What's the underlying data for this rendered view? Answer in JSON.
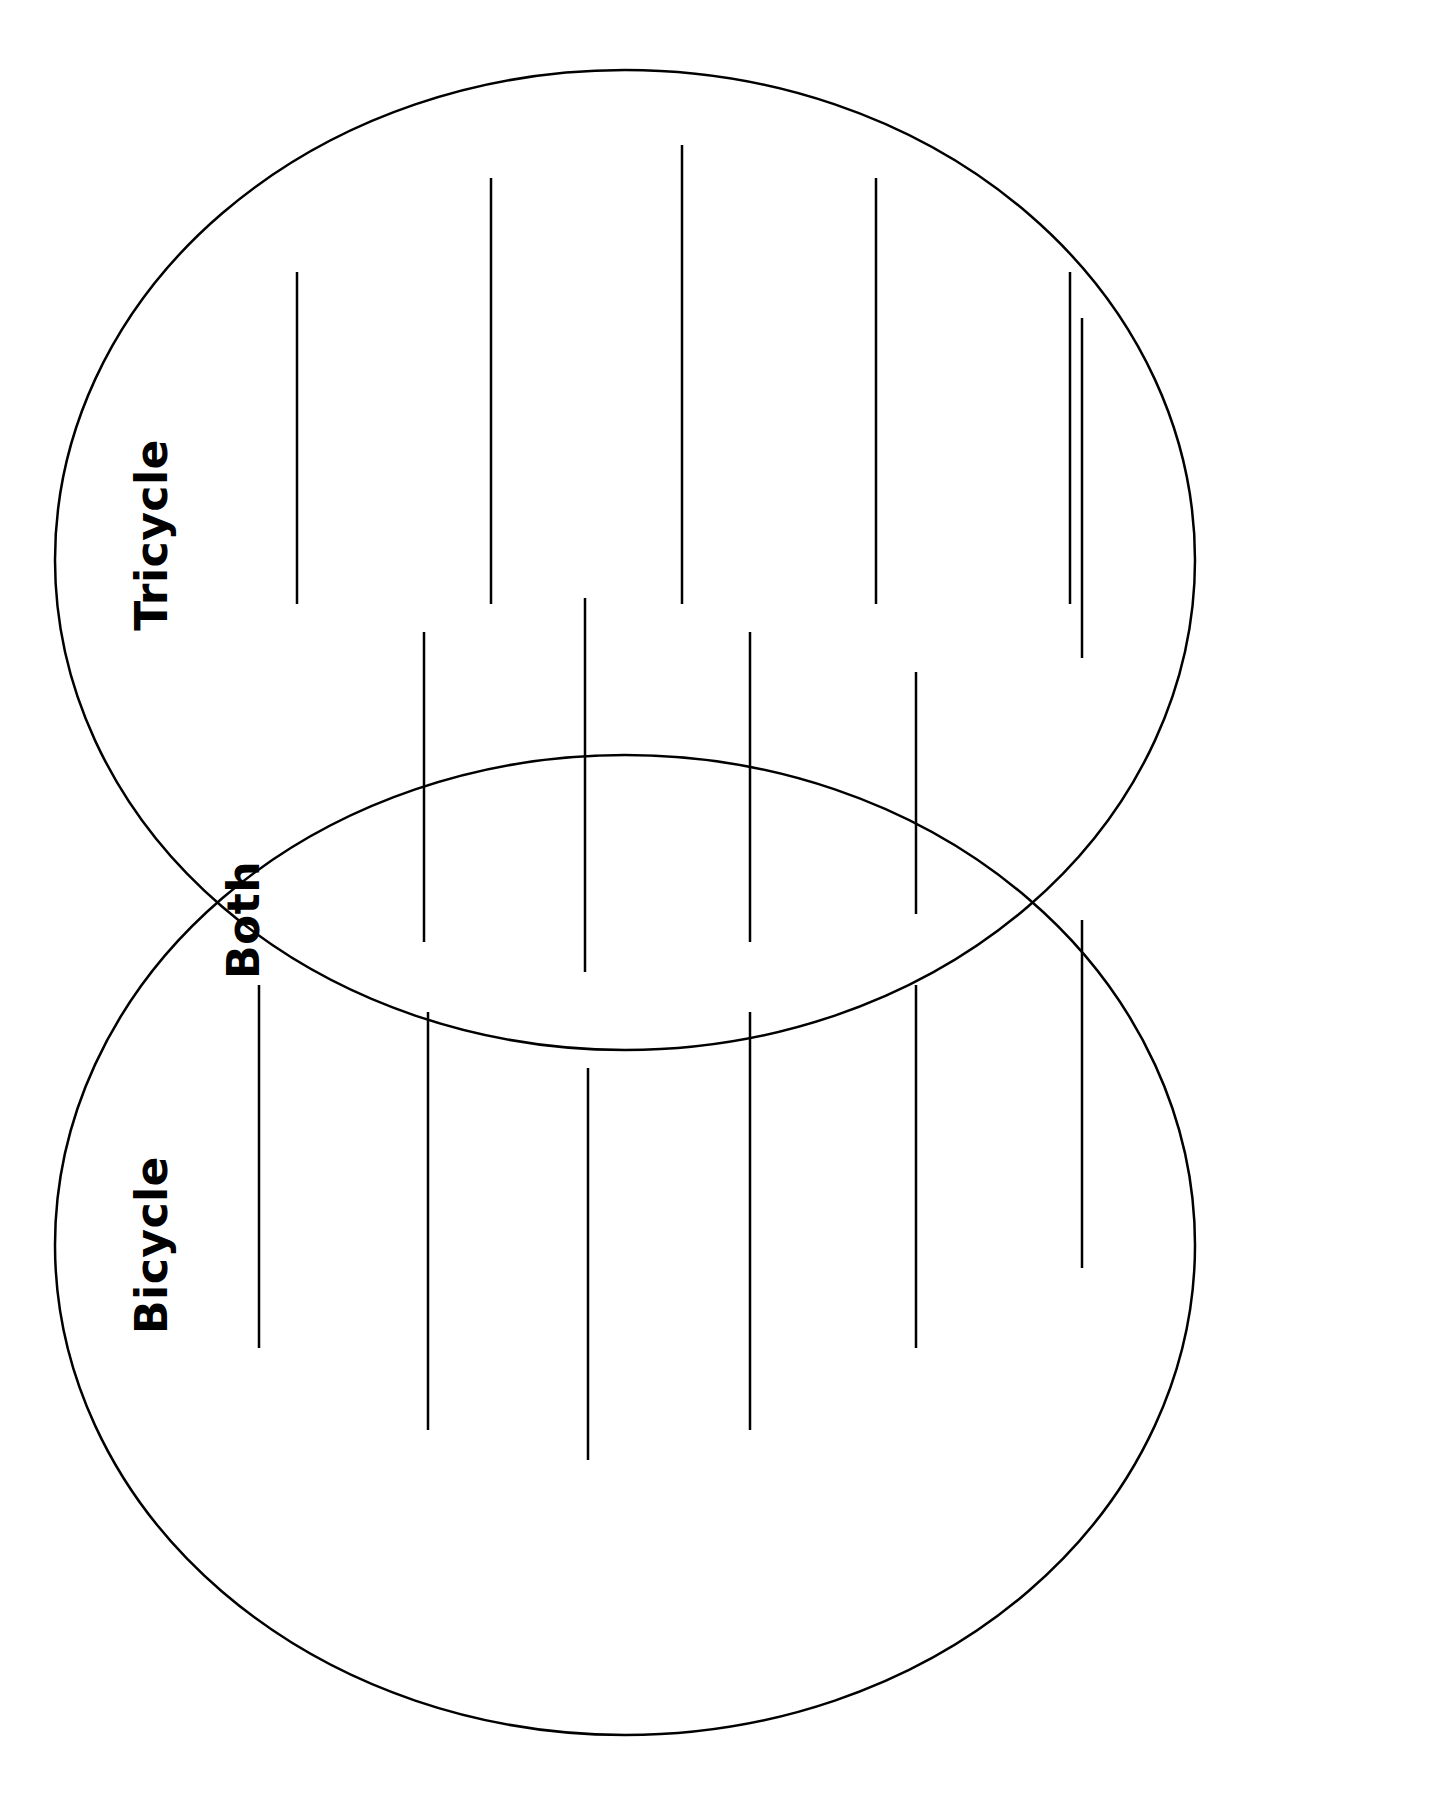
{
  "page": {
    "background_color": "#ffffff",
    "stroke_color": "#000000",
    "text_color": "#000000",
    "width": 1448,
    "height": 1812
  },
  "diagram": {
    "type": "venn-two-set",
    "orientation": "vertical-stacked",
    "stroke_width": 2.5,
    "circles": [
      {
        "id": "tricycle-circle",
        "label": "Tricycle",
        "cx": 625,
        "cy": 560,
        "rx": 570,
        "ry": 490
      },
      {
        "id": "bicycle-circle",
        "label": "Bicycle",
        "cx": 625,
        "cy": 1245,
        "rx": 570,
        "ry": 490
      }
    ],
    "labels": [
      {
        "id": "tricycle-label",
        "text": "Tricycle",
        "x": 152,
        "y": 535,
        "rotation": -90
      },
      {
        "id": "both-label",
        "text": "Both",
        "x": 244,
        "y": 920,
        "rotation": -90
      },
      {
        "id": "bicycle-label",
        "text": "Bicycle",
        "x": 152,
        "y": 1245,
        "rotation": -90
      }
    ],
    "writing_lines": {
      "description": "Vertical writing rules inside each region",
      "stroke_width": 2.5,
      "tricycle": [
        {
          "x": 297,
          "y1": 272,
          "y2": 604
        },
        {
          "x": 491,
          "y1": 178,
          "y2": 604
        },
        {
          "x": 682,
          "y1": 145,
          "y2": 604
        },
        {
          "x": 876,
          "y1": 178,
          "y2": 604
        },
        {
          "x": 1070,
          "y1": 272,
          "y2": 604
        }
      ],
      "both": [
        {
          "x": 424,
          "y1": 632,
          "y2": 942
        },
        {
          "x": 585,
          "y1": 598,
          "y2": 972
        },
        {
          "x": 750,
          "y1": 632,
          "y2": 942
        },
        {
          "x": 916,
          "y1": 672,
          "y2": 914
        },
        {
          "x": 1082,
          "y1": 318,
          "y2": 658
        }
      ],
      "bicycle": [
        {
          "x": 259,
          "y1": 985,
          "y2": 1348
        },
        {
          "x": 428,
          "y1": 1012,
          "y2": 1430
        },
        {
          "x": 588,
          "y1": 1068,
          "y2": 1460
        },
        {
          "x": 750,
          "y1": 1012,
          "y2": 1430
        },
        {
          "x": 916,
          "y1": 985,
          "y2": 1348
        },
        {
          "x": 1082,
          "y1": 920,
          "y2": 1268
        }
      ]
    }
  },
  "ghost_text": {
    "top_cropped": ""
  }
}
